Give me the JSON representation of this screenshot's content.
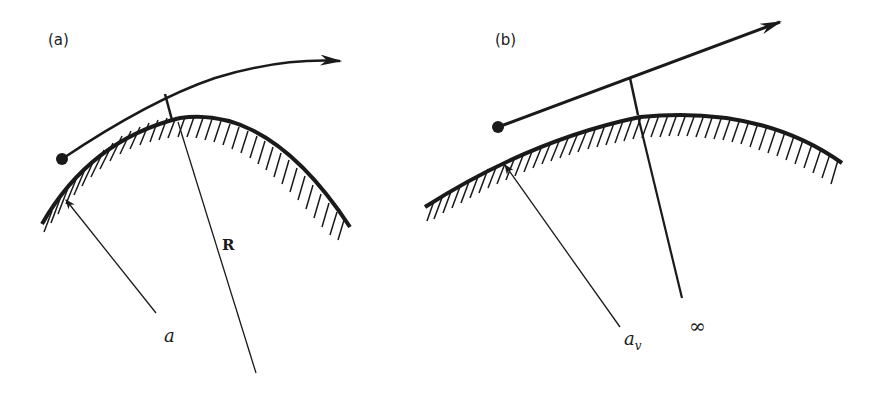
{
  "figure": {
    "panels": [
      {
        "id": "a",
        "label": "(a)",
        "surface": "curved surface (convex, hatched below)",
        "trajectory": "curved path with arrow, starting at dot",
        "radius_labels": {
          "surface_radius": "a",
          "trajectory_radius": "R"
        }
      },
      {
        "id": "b",
        "label": "(b)",
        "surface": "curved surface (convex, hatched below)",
        "trajectory": "straight path with arrow, starting at dot",
        "radius_labels": {
          "surface_radius_main": "a",
          "surface_radius_sub": "v",
          "trajectory_radius": "∞"
        }
      }
    ],
    "colors": {
      "ink": "#1a1a1a",
      "background": "#ffffff"
    }
  }
}
